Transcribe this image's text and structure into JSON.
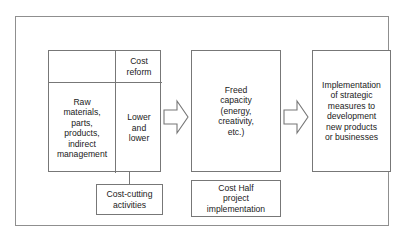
{
  "diagram": {
    "frame": {
      "name": "outer-frame"
    },
    "input_table": {
      "rows": [
        {
          "left_label": "",
          "right_label": "Cost\nreform"
        },
        {
          "left_label": "Raw\nmaterials,\nparts,\nproducts,\nindirect\nmanagement",
          "right_label": "Lower\nand\nlower"
        }
      ]
    },
    "boxes": {
      "cost_cutting": "Cost-cutting\nactivities",
      "freed_capacity": "Freed\ncapacity\n(energy,\ncreativity,\netc.)",
      "cost_half": "Cost Half\nproject\nimplementation",
      "implementation": "Implementation\nof strategic\nmeasures to\ndevelopment\nnew products\nor businesses"
    },
    "arrows": [
      {
        "name": "arrow-input-to-freed-capacity",
        "direction": "right"
      },
      {
        "name": "arrow-freed-capacity-to-implementation",
        "direction": "right"
      }
    ],
    "colors": {
      "background": "#ffffff",
      "border": "#777777",
      "frame_border": "#8f8f8f",
      "text": "#1a1a1a"
    }
  }
}
